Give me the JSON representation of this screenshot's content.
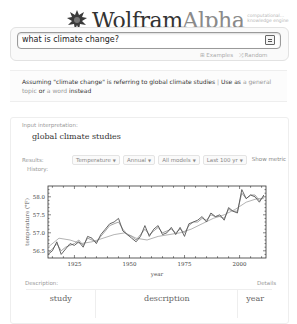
{
  "header": {
    "logo_wolfram": "Wolfram",
    "logo_alpha": "Alpha",
    "logo_tagline_1": "computational...",
    "logo_tagline_2": "knowledge engine"
  },
  "search": {
    "value": "what is climate change?",
    "links": [
      {
        "icon": "examples-icon",
        "label": "Examples"
      },
      {
        "icon": "random-icon",
        "label": "Random"
      }
    ]
  },
  "assumption": {
    "prefix": "Assuming \"climate change\" is referring to global climate studies",
    "separator": "|",
    "use_as": "Use as",
    "option_1": "a general topic",
    "or": "or",
    "option_2": "a word",
    "suffix": "instead"
  },
  "pod": {
    "input_label": "Input interpretation:",
    "input_value": "global climate studies",
    "results_label": "Results:",
    "history_label": "History:",
    "selects": [
      {
        "label": "Temperature"
      },
      {
        "label": "Annual"
      },
      {
        "label": "All models"
      },
      {
        "label": "Last 100 yr"
      }
    ],
    "show_metric": "Show metric",
    "description_label": "Description:",
    "details_label": "Details",
    "table_headers": [
      "study",
      "description",
      "year"
    ]
  },
  "chart_data": {
    "type": "line",
    "title": "",
    "xlabel": "year",
    "ylabel": "temperature (°F)",
    "xlim": [
      1913,
      2012
    ],
    "ylim": [
      56.3,
      58.3
    ],
    "x_ticks": [
      1925,
      1950,
      1975,
      2000
    ],
    "y_ticks": [
      56.5,
      57.0,
      57.5,
      58.0
    ],
    "grid": false,
    "legend": "none",
    "series": [
      {
        "name": "annual (dark)",
        "color": "#555555",
        "x": [
          1913,
          1915,
          1917,
          1919,
          1921,
          1923,
          1925,
          1927,
          1929,
          1931,
          1933,
          1935,
          1937,
          1939,
          1941,
          1943,
          1945,
          1947,
          1949,
          1951,
          1953,
          1955,
          1957,
          1959,
          1961,
          1963,
          1965,
          1967,
          1969,
          1971,
          1973,
          1975,
          1977,
          1979,
          1981,
          1983,
          1985,
          1987,
          1989,
          1991,
          1993,
          1995,
          1997,
          1999,
          2001,
          2003,
          2005,
          2007,
          2009,
          2011
        ],
        "values": [
          56.4,
          56.5,
          56.75,
          56.4,
          56.55,
          56.7,
          56.65,
          56.75,
          56.6,
          56.9,
          56.85,
          56.7,
          56.95,
          57.1,
          57.25,
          57.3,
          57.4,
          57.05,
          56.95,
          56.85,
          56.75,
          56.9,
          57.2,
          56.9,
          57.1,
          57.2,
          56.95,
          57.0,
          57.15,
          56.95,
          57.15,
          56.9,
          57.25,
          57.3,
          57.35,
          57.45,
          57.3,
          57.55,
          57.45,
          57.5,
          57.35,
          57.7,
          57.6,
          57.55,
          58.2,
          57.95,
          58.05,
          58.0,
          57.85,
          58.05
        ]
      },
      {
        "name": "model A (light)",
        "color": "#999999",
        "x": [
          1913,
          1915,
          1917,
          1919,
          1921,
          1923,
          1925,
          1927,
          1929,
          1931,
          1933,
          1935,
          1937,
          1939,
          1941,
          1943,
          1945,
          1947,
          1949,
          1951,
          1953,
          1955,
          1957,
          1959,
          1961,
          1963,
          1965,
          1967,
          1969,
          1971,
          1973,
          1975,
          1977,
          1979,
          1981,
          1983,
          1985,
          1987,
          1989,
          1991,
          1993,
          1995,
          1997,
          1999,
          2001,
          2003,
          2005,
          2007,
          2009,
          2011
        ],
        "values": [
          56.45,
          56.55,
          56.7,
          56.5,
          56.6,
          56.65,
          56.7,
          56.8,
          56.65,
          56.85,
          56.8,
          56.75,
          56.9,
          57.05,
          57.2,
          57.25,
          57.3,
          57.1,
          56.95,
          56.9,
          56.8,
          56.95,
          57.1,
          56.95,
          57.05,
          57.15,
          57.0,
          57.05,
          57.1,
          57.0,
          57.1,
          57.0,
          57.2,
          57.3,
          57.3,
          57.4,
          57.35,
          57.5,
          57.45,
          57.45,
          57.4,
          57.65,
          57.6,
          57.6,
          58.1,
          57.95,
          58.05,
          58.05,
          57.9,
          58.0
        ]
      },
      {
        "name": "smoothed",
        "color": "#aaaaaa",
        "x": [
          1913,
          1918,
          1923,
          1928,
          1933,
          1938,
          1943,
          1948,
          1953,
          1958,
          1963,
          1968,
          1973,
          1978,
          1983,
          1988,
          1993,
          1998,
          2003,
          2008,
          2011
        ],
        "values": [
          56.6,
          56.85,
          56.8,
          56.7,
          56.75,
          56.85,
          56.95,
          57.0,
          56.85,
          56.8,
          56.9,
          56.95,
          57.0,
          57.1,
          57.25,
          57.4,
          57.5,
          57.65,
          57.85,
          57.95,
          57.95
        ]
      }
    ]
  }
}
